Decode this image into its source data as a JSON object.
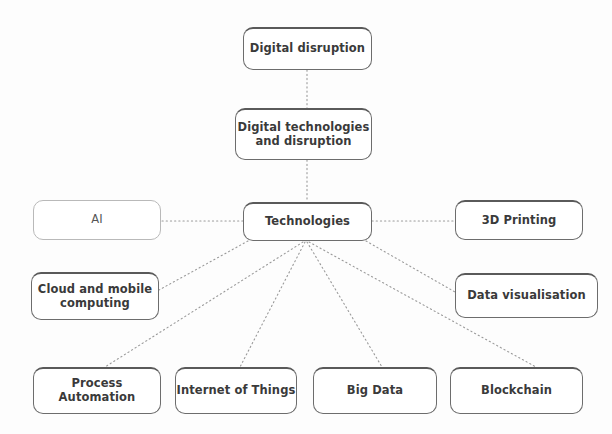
{
  "diagram": {
    "background_color": "#fdfdfd",
    "border_color_heavy": "#6d6d6d",
    "border_color_light": "#b9b9b9",
    "text_color": "#3a3a3a",
    "connector_color": "#9a9a9a",
    "connector_style": "dotted"
  },
  "nodes": {
    "digital_disruption": {
      "label": "Digital disruption",
      "x": 243,
      "y": 27,
      "w": 129,
      "h": 43,
      "style": "heavy"
    },
    "digital_technologies_and_disruption": {
      "label": "Digital technologies\nand disruption",
      "x": 235,
      "y": 108,
      "w": 137,
      "h": 52,
      "style": "heavy"
    },
    "technologies": {
      "label": "Technologies",
      "x": 243,
      "y": 202,
      "w": 129,
      "h": 39,
      "style": "heavy"
    },
    "ai": {
      "label": "AI",
      "x": 33,
      "y": 200,
      "w": 128,
      "h": 40,
      "style": "light"
    },
    "three_d_printing": {
      "label": "3D Printing",
      "x": 455,
      "y": 200,
      "w": 128,
      "h": 40,
      "style": "heavy"
    },
    "cloud_and_mobile_computing": {
      "label": "Cloud and mobile\ncomputing",
      "x": 31,
      "y": 272,
      "w": 128,
      "h": 48,
      "style": "heavy"
    },
    "data_visualisation": {
      "label": "Data visualisation",
      "x": 455,
      "y": 273,
      "w": 143,
      "h": 45,
      "style": "heavy"
    },
    "process_automation": {
      "label": "Process Automation",
      "x": 33,
      "y": 367,
      "w": 128,
      "h": 47,
      "style": "heavy"
    },
    "internet_of_things": {
      "label": "Internet of Things",
      "x": 175,
      "y": 367,
      "w": 122,
      "h": 47,
      "style": "heavy"
    },
    "big_data": {
      "label": "Big Data",
      "x": 313,
      "y": 367,
      "w": 124,
      "h": 47,
      "style": "heavy"
    },
    "blockchain": {
      "label": "Blockchain",
      "x": 450,
      "y": 367,
      "w": 133,
      "h": 47,
      "style": "heavy"
    }
  },
  "connections": [
    {
      "from": "digital_disruption",
      "to": "digital_technologies_and_disruption",
      "x1": 307,
      "y1": 70,
      "x2": 307,
      "y2": 108
    },
    {
      "from": "digital_technologies_and_disruption",
      "to": "technologies",
      "x1": 307,
      "y1": 160,
      "x2": 307,
      "y2": 202
    },
    {
      "from": "technologies",
      "to": "ai",
      "x1": 243,
      "y1": 221,
      "x2": 161,
      "y2": 221
    },
    {
      "from": "technologies",
      "to": "three_d_printing",
      "x1": 372,
      "y1": 221,
      "x2": 455,
      "y2": 221
    },
    {
      "from": "technologies",
      "to": "cloud_and_mobile_computing",
      "x1": 248,
      "y1": 241,
      "x2": 159,
      "y2": 290
    },
    {
      "from": "technologies",
      "to": "process_automation",
      "x1": 303,
      "y1": 242,
      "x2": 105,
      "y2": 367
    },
    {
      "from": "technologies",
      "to": "internet_of_things",
      "x1": 305,
      "y1": 242,
      "x2": 240,
      "y2": 367
    },
    {
      "from": "technologies",
      "to": "big_data",
      "x1": 307,
      "y1": 242,
      "x2": 382,
      "y2": 367
    },
    {
      "from": "technologies",
      "to": "blockchain",
      "x1": 309,
      "y1": 242,
      "x2": 536,
      "y2": 367
    },
    {
      "from": "technologies",
      "to": "data_visualisation",
      "x1": 366,
      "y1": 241,
      "x2": 455,
      "y2": 292
    }
  ]
}
